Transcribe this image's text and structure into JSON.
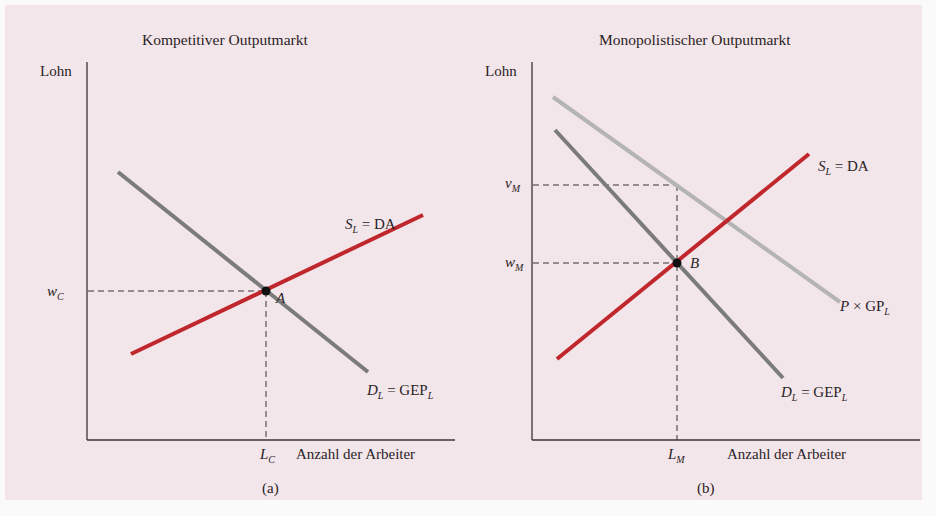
{
  "figure": {
    "panels": [
      {
        "id": "a",
        "title": "Kompetitiver Outputmarkt",
        "y_axis_label": "Lohn",
        "x_axis_label": "Anzahl der Arbeiter",
        "caption": "(a)",
        "wage_label": {
          "main": "w",
          "sub": "C"
        },
        "quantity_label": {
          "main": "L",
          "sub": "C"
        },
        "equilibrium_point": "A",
        "supply_label": {
          "main": "S",
          "sub": "L",
          "rest": " = DA"
        },
        "demand_label": {
          "main": "D",
          "sub": "L",
          "rest": " = GEP",
          "rest_sub": "L"
        }
      },
      {
        "id": "b",
        "title": "Monopolistischer Outputmarkt",
        "y_axis_label": "Lohn",
        "x_axis_label": "Anzahl der Arbeiter",
        "caption": "(b)",
        "value_label": {
          "main": "v",
          "sub": "M"
        },
        "wage_label": {
          "main": "w",
          "sub": "M"
        },
        "quantity_label": {
          "main": "L",
          "sub": "M"
        },
        "equilibrium_point": "B",
        "supply_label": {
          "main": "S",
          "sub": "L",
          "rest": " = DA"
        },
        "demand_label": {
          "main": "D",
          "sub": "L",
          "rest": " = GEP",
          "rest_sub": "L"
        },
        "value_product_label": {
          "main": "P",
          "rest": " × GP",
          "rest_sub": "L"
        }
      }
    ],
    "colors": {
      "background": "#f3e6ea",
      "supply": "#c0272d",
      "demand": "#7b7b7b",
      "value_product": "#b4b4b4",
      "axis": "#3a3336"
    }
  }
}
